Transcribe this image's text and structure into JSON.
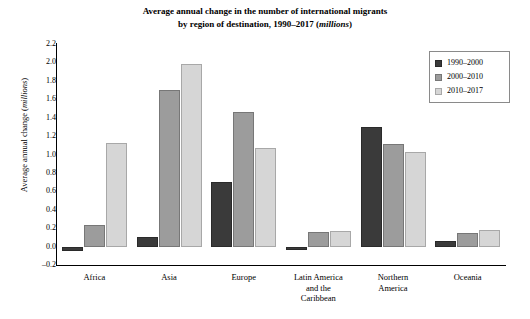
{
  "chart_data": {
    "type": "bar",
    "title_line1": "Average annual change in the number of international migrants",
    "title_line2_main": "by region of destination, 1990–2017 (",
    "title_line2_ital": "millions",
    "title_line2_end": ")",
    "ylabel_main": "Average annual change (",
    "ylabel_ital": "millions",
    "ylabel_end": ")",
    "xlabel": "",
    "ylim": [
      -0.2,
      2.2
    ],
    "ytick_step": 0.2,
    "grid": false,
    "legend_position": "top-right",
    "categories": [
      "Africa",
      "Asia",
      "Europe",
      "Latin America and the Caribbean",
      "Northern America",
      "Oceania"
    ],
    "category_label_lines": [
      [
        "Africa"
      ],
      [
        "Asia"
      ],
      [
        "Europe"
      ],
      [
        "Latin America",
        "and the",
        "Caribbean"
      ],
      [
        "Northern",
        "America"
      ],
      [
        "Oceania"
      ]
    ],
    "yticks": [
      "2.2",
      "2.0",
      "1.8",
      "1.6",
      "1.4",
      "1.2",
      "1.0",
      "0.8",
      "0.6",
      "0.4",
      "0.2",
      "0.0",
      "–0.2"
    ],
    "ytick_values": [
      2.2,
      2.0,
      1.8,
      1.6,
      1.4,
      1.2,
      1.0,
      0.8,
      0.6,
      0.4,
      0.2,
      0.0,
      -0.2
    ],
    "series": [
      {
        "name": "1990–2000",
        "color": "#3a3a3a",
        "values": [
          -0.05,
          0.1,
          0.7,
          -0.04,
          1.3,
          0.06
        ]
      },
      {
        "name": "2000–2010",
        "color": "#9c9c9c",
        "values": [
          0.23,
          1.7,
          1.46,
          0.16,
          1.11,
          0.15
        ]
      },
      {
        "name": "2010–2017",
        "color": "#d6d6d6",
        "values": [
          1.13,
          1.98,
          1.07,
          0.17,
          1.03,
          0.18
        ]
      }
    ]
  }
}
